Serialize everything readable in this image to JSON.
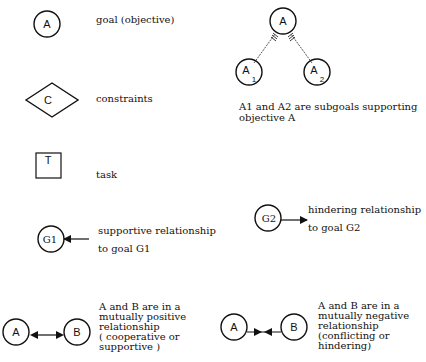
{
  "legend": {
    "goal": {
      "symbol": "A",
      "label": "goal (objective)"
    },
    "constraint": {
      "symbol": "C",
      "label": "constraints"
    },
    "task": {
      "symbol": "T",
      "label": "task"
    },
    "supportive": {
      "node": "G1",
      "line1": "supportive relationship",
      "line2": "to goal  G1"
    },
    "hindering": {
      "node": "G2",
      "line1": "hindering  relationship",
      "line2": "to goal G2"
    },
    "subgoals": {
      "parent": "A",
      "child1": "A",
      "child1_sub": "1",
      "child2": "A",
      "child2_sub": "2",
      "line1": "A1  and  A2 are subgoals supporting",
      "line2": "objective  A"
    },
    "mutual_positive": {
      "node_a": "A",
      "node_b": "B",
      "lines": [
        "A and B are in a",
        "mutually positive",
        "relationship",
        "( cooperative or",
        "supportive )"
      ]
    },
    "mutual_negative": {
      "node_a": "A",
      "node_b": "B",
      "lines": [
        "A  and B are in a",
        "mutually  negative",
        "relationship",
        "(conflicting  or",
        "hindering)"
      ]
    }
  }
}
